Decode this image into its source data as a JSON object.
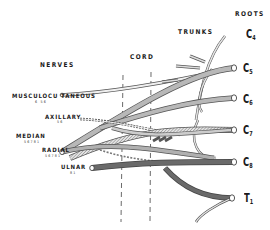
{
  "headers": {
    "nerves": "NERVES",
    "cord": "CORD",
    "trunks": "TRUNKS",
    "roots": "ROOTS"
  },
  "nerves": [
    {
      "name": "MUSCULOCU TANEOUS",
      "sub": "6 56"
    },
    {
      "name": "AXILLARY",
      "sub": "56"
    },
    {
      "name": "MEDIAN",
      "sub": "56781"
    },
    {
      "name": "RADIAL",
      "sub": "56781"
    },
    {
      "name": "ULNAR",
      "sub": "81"
    }
  ],
  "roots": [
    {
      "base": "C",
      "index": "4"
    },
    {
      "base": "C",
      "index": "5"
    },
    {
      "base": "C",
      "index": "6"
    },
    {
      "base": "C",
      "index": "7"
    },
    {
      "base": "C",
      "index": "8"
    },
    {
      "base": "T",
      "index": "1"
    }
  ],
  "colors": {
    "ink": "#1a1a1a",
    "nerve_light": "#b8b8b8",
    "nerve_mid": "#8e8e8e",
    "nerve_dark": "#6a6a6a",
    "outline": "#555555",
    "background": "#ffffff"
  }
}
